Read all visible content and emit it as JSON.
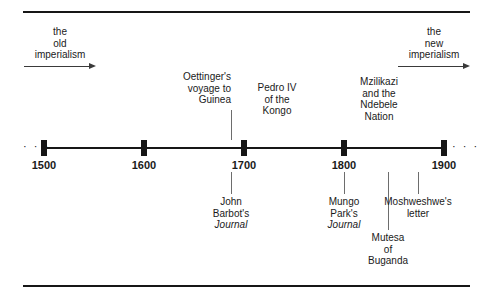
{
  "figure": {
    "axis": {
      "dots_left": "· · ·",
      "dots_right": "· · ·",
      "years": [
        {
          "label": "1500",
          "x": 44
        },
        {
          "label": "1600",
          "x": 144
        },
        {
          "label": "1700",
          "x": 244
        },
        {
          "label": "1800",
          "x": 344
        },
        {
          "label": "1900",
          "x": 444
        }
      ]
    },
    "eras": [
      {
        "name": "old-imperialism",
        "lines": [
          "the",
          "old",
          "imperialism"
        ],
        "arrow_direction": "right"
      },
      {
        "name": "new-imperialism",
        "lines": [
          "the",
          "new",
          "imperialism"
        ],
        "arrow_direction": "right"
      }
    ],
    "annotations_above": [
      {
        "name": "oettingers-voyage-to-guinea",
        "lines": [
          "Oettinger's",
          "voyage to",
          "Guinea"
        ],
        "italic_lines": [],
        "has_leader": true
      },
      {
        "name": "pedro-iv-of-the-kongo",
        "lines": [
          "Pedro IV",
          "of the",
          "Kongo"
        ],
        "italic_lines": [],
        "has_leader": false
      },
      {
        "name": "mzilikazi-and-the-ndebele-nation",
        "lines": [
          "Mzilikazi",
          "and the",
          "Ndebele",
          "Nation"
        ],
        "italic_lines": [],
        "has_leader": false
      }
    ],
    "annotations_below": [
      {
        "name": "john-barbots-journal",
        "lines": [
          "John",
          "Barbot's",
          "Journal"
        ],
        "italic_lines": [
          "Journal"
        ],
        "has_leader": true
      },
      {
        "name": "mungo-parks-journal",
        "lines": [
          "Mungo",
          "Park's",
          "Journal"
        ],
        "italic_lines": [
          "Journal"
        ],
        "has_leader": true
      },
      {
        "name": "mutesa-of-buganda",
        "lines": [
          "Mutesa",
          "of",
          "Buganda"
        ],
        "italic_lines": [],
        "has_leader": true
      },
      {
        "name": "moshweshwes-letter",
        "lines": [
          "Moshweshwe's",
          "letter"
        ],
        "italic_lines": [],
        "has_leader": true
      }
    ],
    "colors": {
      "ink": "#161616",
      "leader": "#6d6d6d",
      "background": "#ffffff"
    }
  }
}
